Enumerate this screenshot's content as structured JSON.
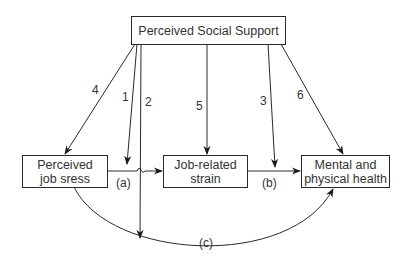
{
  "diagram": {
    "nodes": {
      "support": {
        "label": "Perceived Social Support"
      },
      "stress": {
        "label": "Perceived\njob sress"
      },
      "strain": {
        "label": "Job-related\nstrain"
      },
      "health": {
        "label": "Mental and\nphysical health"
      }
    },
    "edges": [
      {
        "id": "1",
        "from": "support",
        "to": "path-a",
        "label": "1"
      },
      {
        "id": "2",
        "from": "support",
        "to": "path-c",
        "label": "2"
      },
      {
        "id": "3",
        "from": "support",
        "to": "path-b",
        "label": "3"
      },
      {
        "id": "4",
        "from": "support",
        "to": "stress",
        "label": "4"
      },
      {
        "id": "5",
        "from": "support",
        "to": "strain",
        "label": "5"
      },
      {
        "id": "6",
        "from": "support",
        "to": "health",
        "label": "6"
      },
      {
        "id": "a",
        "from": "stress",
        "to": "strain",
        "label": "(a)"
      },
      {
        "id": "b",
        "from": "strain",
        "to": "health",
        "label": "(b)"
      },
      {
        "id": "c",
        "from": "stress",
        "to": "health",
        "label": "(c)"
      }
    ],
    "line_color": "#2a2a2a"
  }
}
